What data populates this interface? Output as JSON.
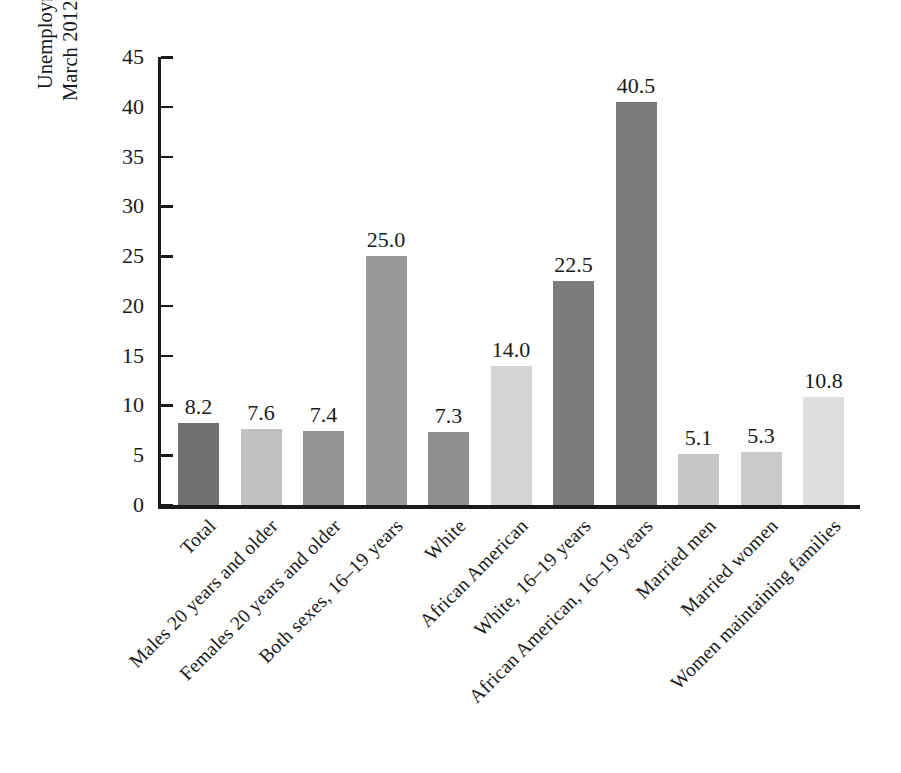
{
  "chart_data": {
    "type": "bar",
    "title": "",
    "subtitle": "",
    "xlabel": "",
    "ylabel_lines": [
      "Unemployment rates,",
      "March 2012 (in percent)"
    ],
    "ylabel": "Unemployment rates, March 2012 (in percent)",
    "ylim": [
      0,
      45
    ],
    "ytick_labels": [
      "45",
      "40",
      "35",
      "30",
      "25",
      "20",
      "15",
      "10",
      "5",
      "0"
    ],
    "ytick_values": [
      45,
      40,
      35,
      30,
      25,
      20,
      15,
      10,
      5,
      0
    ],
    "grid": false,
    "legend": "none",
    "categories": [
      "Total",
      "Males 20 years and older",
      "Females 20 years and older",
      "Both sexes, 16–19 years",
      "White",
      "African American",
      "White, 16–19 years",
      "African American, 16–19 years",
      "Married men",
      "Married women",
      "Women maintaining families"
    ],
    "values": [
      8.2,
      7.6,
      7.4,
      25.0,
      7.3,
      14.0,
      22.5,
      40.5,
      5.1,
      5.3,
      10.8
    ],
    "value_labels": [
      "8.2",
      "7.6",
      "7.4",
      "25.0",
      "7.3",
      "14.0",
      "22.5",
      "40.5",
      "5.1",
      "5.3",
      "10.8"
    ],
    "bar_colors": [
      "#6f6f6f",
      "#c0c0c0",
      "#949494",
      "#9a9a9a",
      "#8e8e8e",
      "#d4d4d4",
      "#7c7c7c",
      "#7a7a7a",
      "#c6c6c6",
      "#cbcbcb",
      "#dedede"
    ],
    "axis_color": "#1a1a1a",
    "background_color": "#ffffff"
  }
}
